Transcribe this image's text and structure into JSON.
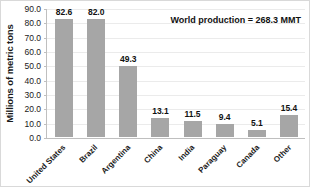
{
  "chart_data": {
    "type": "bar",
    "title": "",
    "xlabel": "",
    "ylabel": "Millions of metric tons",
    "ylim": [
      0,
      90
    ],
    "ytick_step": 10,
    "grid": true,
    "legend": "none",
    "categories": [
      "United States",
      "Brazil",
      "Argentina",
      "China",
      "India",
      "Paraguay",
      "Canada",
      "Other"
    ],
    "values": [
      82.6,
      82.0,
      49.3,
      13.1,
      11.5,
      9.4,
      5.1,
      15.4
    ],
    "value_labels": [
      "82.6",
      "82.0",
      "49.3",
      "13.1",
      "11.5",
      "9.4",
      "5.1",
      "15.4"
    ],
    "ytick_labels": [
      "90.0",
      "80.0",
      "70.0",
      "60.0",
      "50.0",
      "40.0",
      "30.0",
      "20.0",
      "10.0",
      "0.0"
    ],
    "annotations": [
      "World production = 268.3 MMT"
    ],
    "bar_color": "#a6a6a6",
    "grid_color": "#ebebeb",
    "axis_color": "#bfbfbf",
    "text_color": "#1a1a1a"
  },
  "annotation": {
    "text": "World production = 268.3 MMT"
  },
  "axis": {
    "y_title": "Millions of metric tons"
  }
}
